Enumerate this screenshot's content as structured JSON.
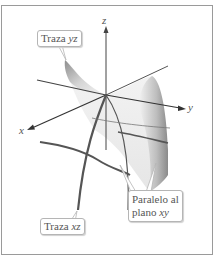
{
  "figure": {
    "axes": {
      "x": "x",
      "y": "y",
      "z": "z"
    },
    "callouts": {
      "yz_trace": {
        "prefix": "Traza",
        "var": "yz"
      },
      "xz_trace": {
        "prefix": "Traza",
        "var": "xz"
      },
      "parallel_xy_line1": "Paralelo al",
      "parallel_xy_line2_prefix": "plano",
      "parallel_xy_var": "xy"
    },
    "colors": {
      "frame": "#9a9a9a",
      "axis": "#444444",
      "trace": "#555555",
      "surface_dark": "#9c9c9c",
      "surface_light": "#f2f2f2"
    }
  }
}
